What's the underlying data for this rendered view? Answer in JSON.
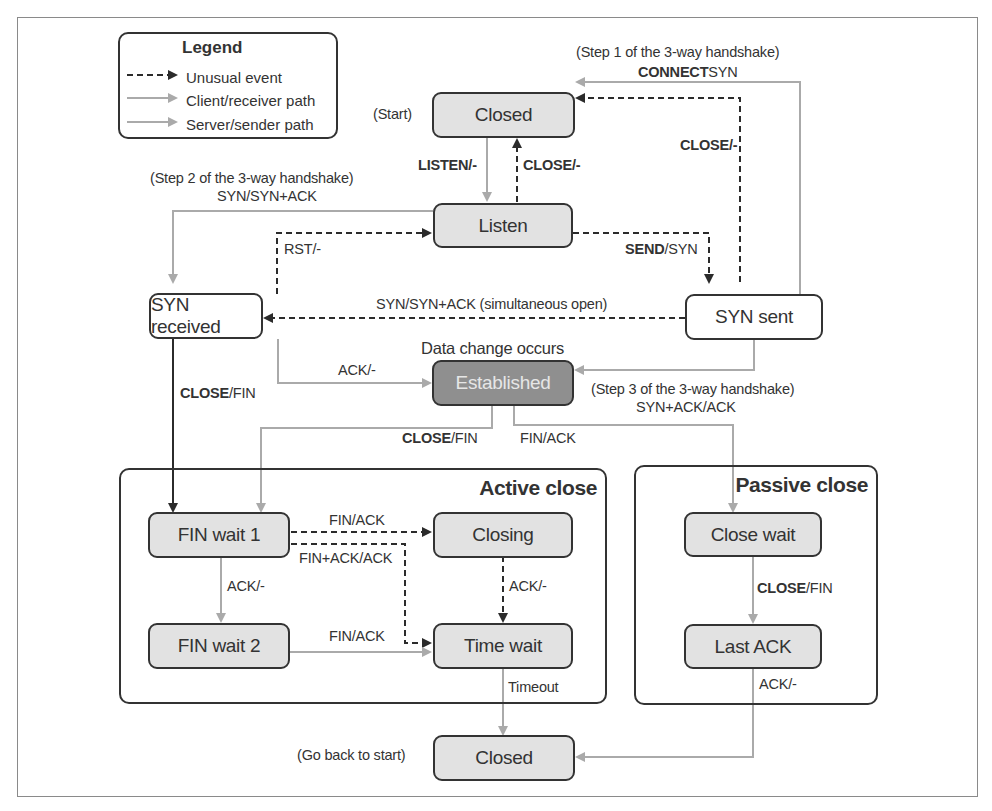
{
  "legend": {
    "title": "Legend",
    "items": [
      {
        "label": "Unusual event",
        "style": "dashed",
        "color": "#2b2b2b"
      },
      {
        "label": "Client/receiver path",
        "style": "solid",
        "color": "#aaaaaa"
      },
      {
        "label": "Server/sender path",
        "style": "solid",
        "color": "#aaaaaa"
      }
    ]
  },
  "states": {
    "closed_top": "Closed",
    "listen": "Listen",
    "syn_received": "SYN received",
    "syn_sent": "SYN sent",
    "established": "Established",
    "fin_wait_1": "FIN wait 1",
    "closing": "Closing",
    "fin_wait_2": "FIN wait 2",
    "time_wait": "Time wait",
    "close_wait": "Close wait",
    "last_ack": "Last ACK",
    "closed_bottom": "Closed"
  },
  "groups": {
    "active_close": "Active close",
    "passive_close": "Passive close"
  },
  "annotations": {
    "start": "(Start)",
    "go_back": "(Go back to start)",
    "step1": "(Step 1 of the 3-way handshake)",
    "step2": "(Step 2 of the 3-way handshake)",
    "step3": "(Step 3 of the 3-way handshake)",
    "data_change": "Data change occurs"
  },
  "transitions": {
    "connect_syn_bold": "CONNECT",
    "connect_syn_rest": "SYN",
    "close_synsent_bold": "CLOSE",
    "close_synsent_rest": "/-",
    "listen_bold": "LISTEN",
    "listen_rest": "/-",
    "close_listen_bold": "CLOSE",
    "close_listen_rest": "/-",
    "syn_synack": "SYN/SYN+ACK",
    "rst": "RST/-",
    "send_bold": "SEND",
    "send_rest": "/SYN",
    "simultaneous": "SYN/SYN+ACK (simultaneous open)",
    "ack_synrecv": "ACK/-",
    "close_fin_synrecv_bold": "CLOSE",
    "close_fin_synrecv_rest": "/FIN",
    "synack_ack": "SYN+ACK/ACK",
    "close_fin_est_bold": "CLOSE",
    "close_fin_est_rest": "/FIN",
    "fin_ack_est": "FIN/ACK",
    "fin_ack_fw1": "FIN/ACK",
    "finack_ack": "FIN+ACK/ACK",
    "ack_fw1": "ACK/-",
    "ack_closing": "ACK/-",
    "fin_ack_fw2": "FIN/ACK",
    "timeout": "Timeout",
    "close_fin_cw_bold": "CLOSE",
    "close_fin_cw_rest": "/FIN",
    "ack_lastack": "ACK/-"
  }
}
